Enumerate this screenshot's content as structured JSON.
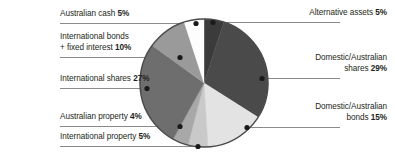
{
  "chart_data": {
    "type": "pie",
    "title": "",
    "xlabel": "",
    "ylabel": "",
    "legend_position": "callout-labels",
    "grid": false,
    "units": "percent",
    "total": 100,
    "start_angle_deg": 0,
    "direction": "clockwise",
    "categories": [
      "Alternative assets",
      "Domestic/Australian shares",
      "Domestic/Australian bonds",
      "International property",
      "Australian property",
      "International shares",
      "International bonds + fixed interest",
      "Australian cash"
    ],
    "values": [
      5,
      29,
      15,
      5,
      4,
      27,
      10,
      5
    ],
    "slices": [
      {
        "label": "Alternative assets",
        "value": 5,
        "value_text": "5%",
        "color": "#3b3b3b",
        "start": 0,
        "end": 18
      },
      {
        "label": "Domestic/Australian shares",
        "value": 29,
        "value_text": "29%",
        "color": "#4a4a4a",
        "start": 18,
        "end": 122.4
      },
      {
        "label": "Domestic/Australian bonds",
        "value": 15,
        "value_text": "15%",
        "color": "#e3e3e3",
        "start": 122.4,
        "end": 176.4
      },
      {
        "label": "International property",
        "value": 5,
        "value_text": "5%",
        "color": "#c9c9c9",
        "start": 176.4,
        "end": 194.4
      },
      {
        "label": "Australian property",
        "value": 4,
        "value_text": "4%",
        "color": "#a8a8a8",
        "start": 194.4,
        "end": 208.8
      },
      {
        "label": "International shares",
        "value": 27,
        "value_text": "27%",
        "color": "#6e6e6e",
        "start": 208.8,
        "end": 306
      },
      {
        "label": "International bonds + fixed interest",
        "value": 10,
        "value_text": "10%",
        "color": "#9a9a9a",
        "start": 306,
        "end": 342
      },
      {
        "label": "Australian cash",
        "value": 5,
        "value_text": "5%",
        "color": "#fdfdfd",
        "start": 342,
        "end": 360
      }
    ]
  },
  "labels": {
    "australian_cash": {
      "line1": "Australian cash ",
      "pct": "5%"
    },
    "international_bonds": {
      "line1": "International bonds",
      "line2": "+ fixed interest  ",
      "pct": "10%"
    },
    "international_shares": {
      "line1": "International shares ",
      "pct": "27%"
    },
    "australian_property": {
      "line1": "Australian property ",
      "pct": "4%"
    },
    "international_property": {
      "line1": "International property ",
      "pct": "5%"
    },
    "alternative_assets": {
      "line1": "Alternative assets ",
      "pct": "5%"
    },
    "domestic_shares": {
      "line1": "Domestic/Australian",
      "line2": "shares ",
      "pct": "29%"
    },
    "domestic_bonds": {
      "line1": "Domestic/Australian",
      "line2": "bonds ",
      "pct": "15%"
    }
  },
  "style": {
    "leader_line_color": "#8a8a8a",
    "dot_color": "#1a1a1a",
    "pie_outline_color": "#4a4a4a",
    "text_color": "#231f20"
  }
}
